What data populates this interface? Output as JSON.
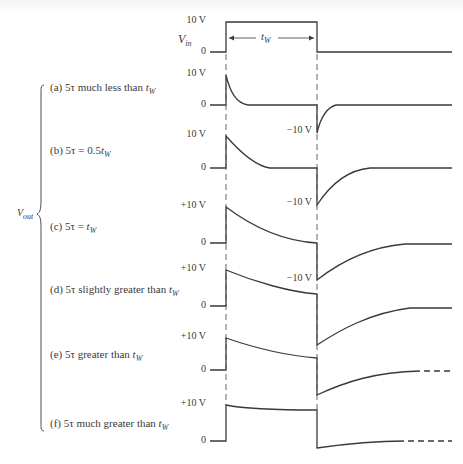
{
  "figure": {
    "input": {
      "name": "V",
      "sub": "in",
      "high_label": "10 V",
      "zero_label": "0",
      "width_label": "t",
      "width_sub": "W"
    },
    "output_label": {
      "name": "V",
      "sub": "out"
    },
    "cases": [
      {
        "id": "a",
        "prefix": "(a) 5τ much less than ",
        "t": "t",
        "sub": "W",
        "pos_label": "10 V",
        "zero_label": "0",
        "neg_label": "−10 V"
      },
      {
        "id": "b",
        "prefix": "(b) 5τ  =  0.5",
        "t": "t",
        "sub": "W",
        "pos_label": "10 V",
        "zero_label": "0",
        "neg_label": "−10 V"
      },
      {
        "id": "c",
        "prefix": "(c) 5τ  =  ",
        "t": "t",
        "sub": "W",
        "pos_label": "+10 V",
        "zero_label": "0",
        "neg_label": "−10 V"
      },
      {
        "id": "d",
        "prefix": "(d) 5τ slightly greater than ",
        "t": "t",
        "sub": "W",
        "pos_label": "+10 V",
        "zero_label": "0",
        "neg_label": ""
      },
      {
        "id": "e",
        "prefix": "(e) 5τ greater than ",
        "t": "t",
        "sub": "W",
        "pos_label": "+10 V",
        "zero_label": "0",
        "neg_label": ""
      },
      {
        "id": "f",
        "prefix": "(f) 5τ much greater than ",
        "t": "t",
        "sub": "W",
        "pos_label": "+10 V",
        "zero_label": "0",
        "neg_label": ""
      }
    ]
  },
  "style": {
    "line_color": "#3a3a3a",
    "dash_color": "#555555"
  }
}
